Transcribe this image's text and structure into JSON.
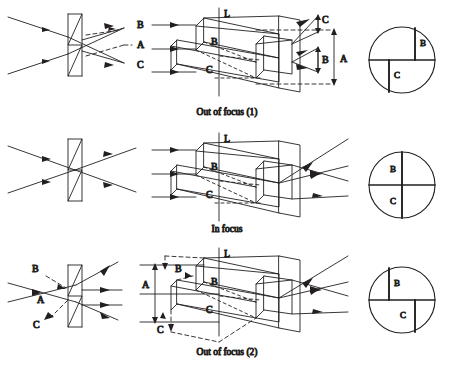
{
  "figure": {
    "background_color": "#ffffff",
    "ink_color": "#231f20",
    "rows": [
      {
        "id": "out-of-focus-1",
        "caption": "Out of focus (1)",
        "ray_labels": [
          "B",
          "A",
          "C"
        ],
        "prism_labels": [
          "L",
          "B",
          "C"
        ],
        "dimension_labels": [
          "C",
          "B",
          "A"
        ],
        "dimension_side": "right",
        "detector": {
          "upper_mark_label": "B",
          "upper_mark_side": "right",
          "lower_mark_label": "C",
          "lower_mark_side": "left",
          "split": "offset"
        }
      },
      {
        "id": "in-focus",
        "caption": "In focus",
        "ray_labels": [],
        "prism_labels": [
          "L",
          "B",
          "C"
        ],
        "dimension_labels": [],
        "dimension_side": "none",
        "detector": {
          "upper_mark_label": "B",
          "upper_mark_side": "center",
          "lower_mark_label": "C",
          "lower_mark_side": "center",
          "split": "aligned"
        }
      },
      {
        "id": "out-of-focus-2",
        "caption": "Out of focus (2)",
        "ray_labels": [
          "B",
          "A",
          "C"
        ],
        "prism_labels": [
          "L",
          "B",
          "C"
        ],
        "dimension_labels": [
          "A",
          "B",
          "C"
        ],
        "dimension_side": "left",
        "detector": {
          "upper_mark_label": "B",
          "upper_mark_side": "left",
          "lower_mark_label": "C",
          "lower_mark_side": "right",
          "split": "offset-reversed"
        }
      }
    ]
  }
}
